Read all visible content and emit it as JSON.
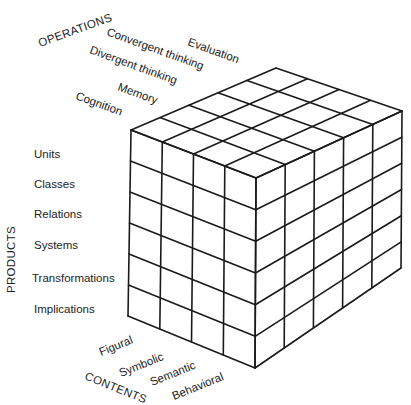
{
  "diagram": {
    "operations": {
      "axis_label": "OPERATIONS",
      "items": [
        "Evaluation",
        "Convergent thinking",
        "Divergent thinking",
        "Memory",
        "Cognition"
      ]
    },
    "products": {
      "axis_label": "PRODUCTS",
      "items": [
        "Units",
        "Classes",
        "Relations",
        "Systems",
        "Transformations",
        "Implications"
      ]
    },
    "contents": {
      "axis_label": "CONTENTS",
      "items": [
        "Figural",
        "Symbolic",
        "Semantic",
        "Behavioral"
      ]
    },
    "cube": {
      "contents_count": 4,
      "operations_count": 5,
      "products_count": 6,
      "line_color": "#1a1a1a",
      "background": "#ffffff"
    }
  }
}
